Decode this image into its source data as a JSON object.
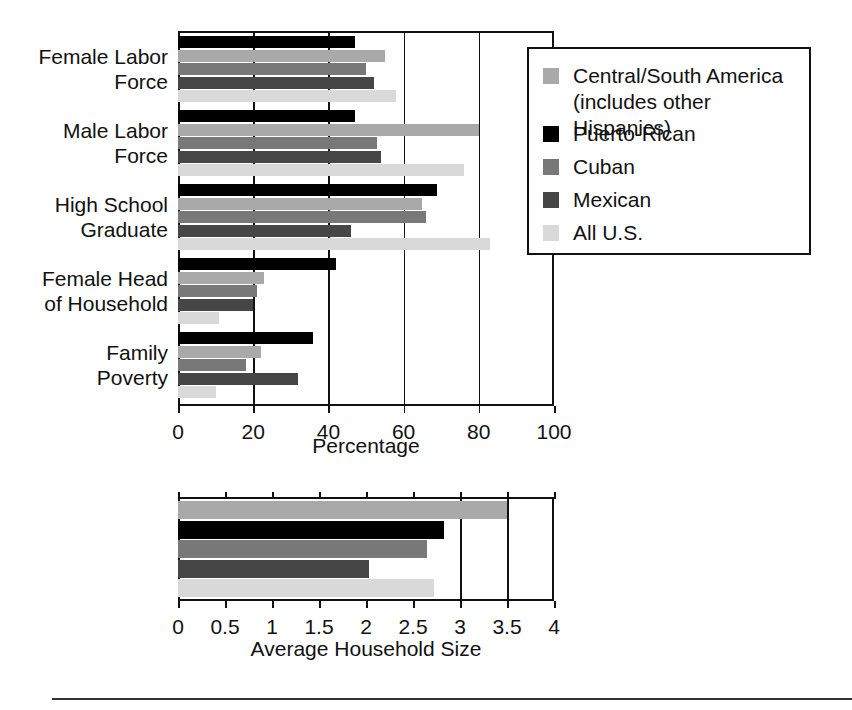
{
  "figure": {
    "legend": {
      "title": "",
      "entries": [
        {
          "label": "Central/South America\n(includes other Hispanics)",
          "key": "central_south",
          "color": "#a9a9a9"
        },
        {
          "label": "Puerto-Rican",
          "key": "puerto_rican",
          "color": "#000000"
        },
        {
          "label": "Cuban",
          "key": "cuban",
          "color": "#787878"
        },
        {
          "label": "Mexican",
          "key": "mexican",
          "color": "#464646"
        },
        {
          "label": "All U.S.",
          "key": "all_us",
          "color": "#d9d9d9"
        }
      ]
    }
  },
  "chart_data": [
    {
      "type": "bar",
      "orientation": "horizontal",
      "title": "",
      "xlabel": "Percentage",
      "ylabel": "",
      "xlim": [
        0,
        100
      ],
      "xticks": [
        0,
        20,
        40,
        60,
        80,
        100
      ],
      "xticklabels": [
        "0",
        "20",
        "40",
        "60",
        "80",
        "100"
      ],
      "grid": "vertical",
      "legend_position": "right-top",
      "categories": [
        "Female Labor\nForce",
        "Male Labor\nForce",
        "High School\nGraduate",
        "Female Head\nof Household",
        "Family\nPoverty"
      ],
      "series": [
        {
          "name": "Puerto-Rican",
          "color": "#000000",
          "values": [
            47,
            47,
            69,
            42,
            36
          ]
        },
        {
          "name": "Central/South America",
          "color": "#a9a9a9",
          "values": [
            55,
            80,
            65,
            23,
            22
          ]
        },
        {
          "name": "Cuban",
          "color": "#787878",
          "values": [
            50,
            53,
            66,
            21,
            18
          ]
        },
        {
          "name": "Mexican",
          "color": "#464646",
          "values": [
            52,
            54,
            46,
            20,
            32
          ]
        },
        {
          "name": "All U.S.",
          "color": "#d9d9d9",
          "values": [
            58,
            76,
            83,
            11,
            10
          ]
        }
      ]
    },
    {
      "type": "bar",
      "orientation": "horizontal",
      "title": "",
      "xlabel": "Average Household Size",
      "ylabel": "",
      "xlim": [
        0,
        4
      ],
      "xticks": [
        0,
        0.5,
        1,
        1.5,
        2,
        2.5,
        3,
        3.5,
        4
      ],
      "xticklabels": [
        "0",
        "0.5",
        "1",
        "1.5",
        "2",
        "2.5",
        "3",
        "3.5",
        "4"
      ],
      "grid": "vertical",
      "legend_position": "none",
      "categories": [
        "Average Household Size"
      ],
      "series": [
        {
          "name": "Central/South America",
          "color": "#a9a9a9",
          "values": [
            3.5
          ]
        },
        {
          "name": "Puerto-Rican",
          "color": "#000000",
          "values": [
            2.83
          ]
        },
        {
          "name": "Cuban",
          "color": "#787878",
          "values": [
            2.65
          ]
        },
        {
          "name": "Mexican",
          "color": "#464646",
          "values": [
            2.03
          ]
        },
        {
          "name": "All U.S.",
          "color": "#d9d9d9",
          "values": [
            2.72
          ]
        }
      ]
    }
  ]
}
